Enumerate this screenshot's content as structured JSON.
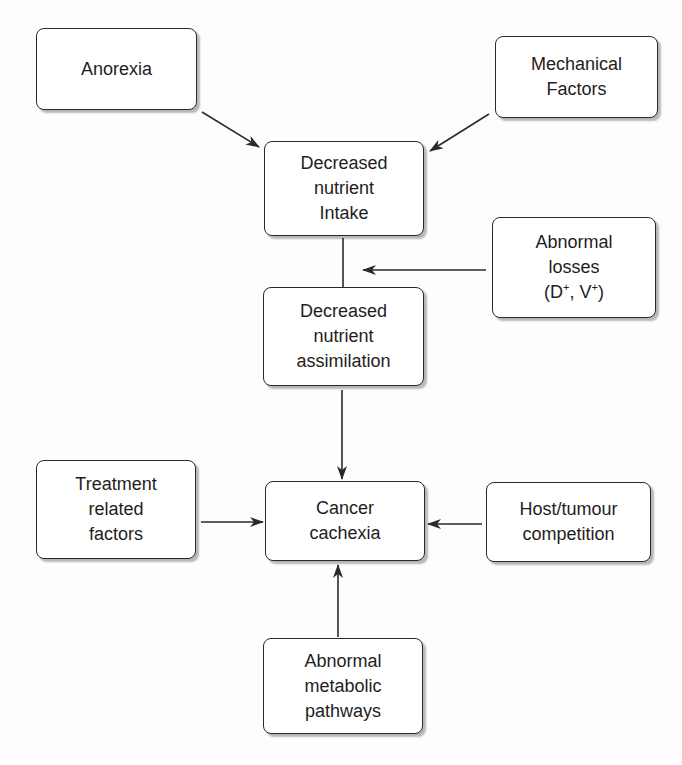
{
  "diagram": {
    "title": "",
    "stroke_color": "#2a2a2a",
    "text_color": "#1e1e1e",
    "nodes": {
      "anorexia": {
        "label": "Anorexia"
      },
      "mechanical": {
        "label": "Mechanical\nFactors"
      },
      "intake": {
        "label": "Decreased\nnutrient\nIntake"
      },
      "losses": {
        "label_line1": "Abnormal",
        "label_line2": "losses",
        "label_line3_a": "(D",
        "label_line3_sup1": "+",
        "label_line3_b": ", V",
        "label_line3_sup2": "+",
        "label_line3_c": ")"
      },
      "assimilation": {
        "label": "Decreased\nnutrient\nassimilation"
      },
      "treatment": {
        "label": "Treatment\nrelated\nfactors"
      },
      "cachexia": {
        "label": "Cancer\ncachexia"
      },
      "host": {
        "label": "Host/tumour\ncompetition"
      },
      "metabolic": {
        "label": "Abnormal\nmetabolic\npathways"
      }
    },
    "edges": [
      {
        "from": "Anorexia",
        "to": "Decreased nutrient Intake"
      },
      {
        "from": "Mechanical Factors",
        "to": "Decreased nutrient Intake"
      },
      {
        "from": "Decreased nutrient Intake",
        "to": "Decreased nutrient assimilation",
        "arrow": false
      },
      {
        "from": "Abnormal losses (D+, V+)",
        "to": "Intake-assimilation link"
      },
      {
        "from": "Decreased nutrient assimilation",
        "to": "Cancer cachexia"
      },
      {
        "from": "Treatment related factors",
        "to": "Cancer cachexia"
      },
      {
        "from": "Host/tumour competition",
        "to": "Cancer cachexia"
      },
      {
        "from": "Abnormal metabolic pathways",
        "to": "Cancer cachexia"
      }
    ]
  }
}
